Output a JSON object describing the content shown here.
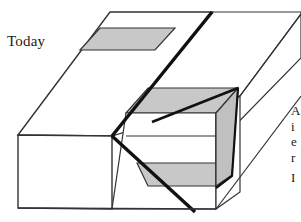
{
  "figure": {
    "type": "geologic-block-diagram",
    "labels": {
      "today": "Today",
      "right_caption_line1": "A",
      "right_caption_line2": "i",
      "right_caption_line3": "e",
      "right_caption_line4": "r",
      "right_caption_line5": "I"
    },
    "colors": {
      "background": "#ffffff",
      "outline": "#333333",
      "fault_line": "#111111",
      "bed_fill": "#c8c8c8",
      "fault_plane_fill": "#c0c0c0",
      "rock_fill": "#ffffff",
      "text": "#1a1a1a"
    },
    "geometry": {
      "note": "Isometric block cut by a normal fault; shaded marker bed is offset across the fault",
      "footwall_top_bed": "gray band on upper-left top surface",
      "hangingwall_top_bed": "gray band on lowered right top surface",
      "front_face_bed": "gray band on downdropped front face",
      "fault_plane": "exposed gray sliver along right side"
    }
  }
}
